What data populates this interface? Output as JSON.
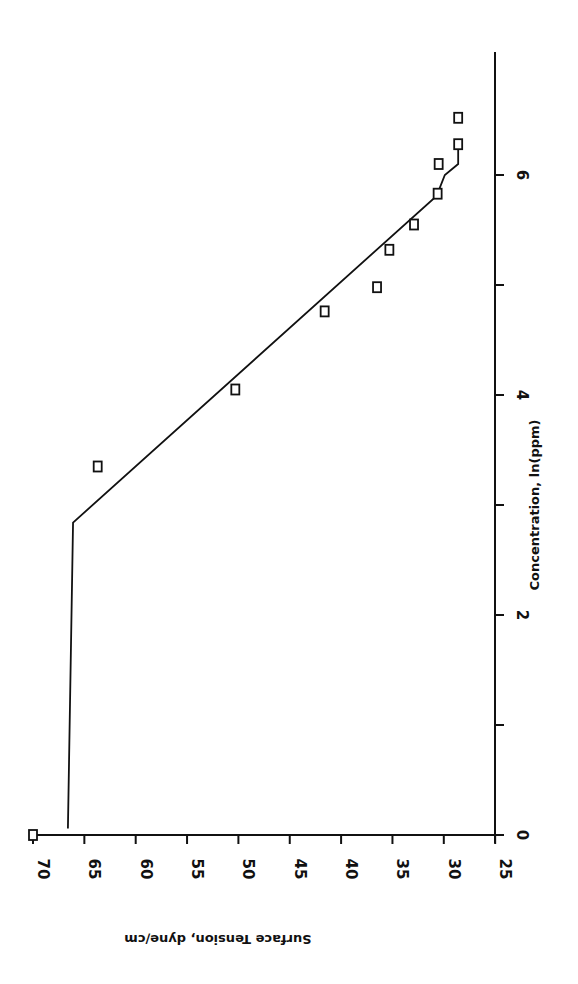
{
  "chart_data": {
    "type": "scatter",
    "orientation_note": "figure rendered rotated 90 degrees clockwise",
    "title": "",
    "xlabel": "Concentration, ln(ppm)",
    "ylabel": "Surface Tension, dyne/cm",
    "xlim": [
      0,
      7
    ],
    "ylim": [
      25,
      70
    ],
    "x_ticks": [
      0,
      2,
      4,
      6
    ],
    "x_minor_ticks": [
      1,
      3,
      5
    ],
    "y_ticks": [
      70,
      65,
      60,
      55,
      50,
      45,
      40,
      35,
      30,
      25
    ],
    "grid": false,
    "legend": null,
    "series": [
      {
        "name": "measured",
        "marker": "open-square",
        "points": [
          {
            "x": 0.0,
            "y": 70.0
          },
          {
            "x": 3.35,
            "y": 63.7
          },
          {
            "x": 4.05,
            "y": 50.3
          },
          {
            "x": 4.76,
            "y": 41.6
          },
          {
            "x": 4.98,
            "y": 36.5
          },
          {
            "x": 5.32,
            "y": 35.3
          },
          {
            "x": 5.55,
            "y": 32.9
          },
          {
            "x": 5.83,
            "y": 30.6
          },
          {
            "x": 6.1,
            "y": 30.5
          },
          {
            "x": 6.28,
            "y": 28.6
          },
          {
            "x": 6.52,
            "y": 28.6
          }
        ]
      },
      {
        "name": "fit",
        "marker": "line",
        "points": [
          {
            "x": 0.06,
            "y": 66.6
          },
          {
            "x": 2.84,
            "y": 66.1
          },
          {
            "x": 5.81,
            "y": 30.7
          },
          {
            "x": 6.0,
            "y": 29.9
          },
          {
            "x": 6.1,
            "y": 28.6
          },
          {
            "x": 6.28,
            "y": 28.6
          }
        ]
      }
    ]
  }
}
